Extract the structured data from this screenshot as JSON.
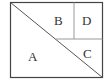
{
  "diagram": {
    "regions": [
      {
        "id": "A",
        "label": "A"
      },
      {
        "id": "B",
        "label": "B"
      },
      {
        "id": "C",
        "label": "C"
      },
      {
        "id": "D",
        "label": "D"
      }
    ],
    "colors": {
      "outline": "#444444",
      "divider": "#888888",
      "background": "#ffffff"
    }
  }
}
